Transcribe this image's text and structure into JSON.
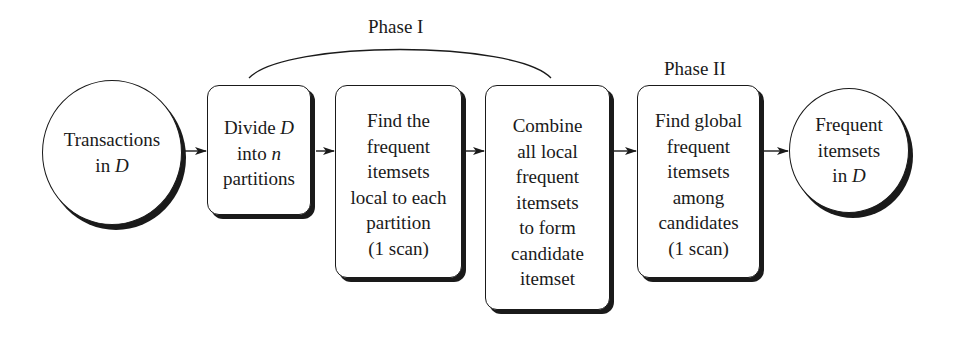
{
  "diagram": {
    "type": "flowchart",
    "phases": [
      {
        "label": "Phase I",
        "spans": [
          "divide",
          "find_local",
          "combine"
        ]
      },
      {
        "label": "Phase II",
        "spans": [
          "find_global"
        ]
      }
    ],
    "nodes": [
      {
        "id": "input",
        "shape": "circle",
        "lines": [
          "Transactions",
          "in D"
        ]
      },
      {
        "id": "divide",
        "shape": "rounded-box",
        "lines": [
          "Divide D",
          "into n",
          "partitions"
        ]
      },
      {
        "id": "find_local",
        "shape": "rounded-box",
        "lines": [
          "Find the",
          "frequent",
          "itemsets",
          "local to each",
          "partition",
          "(1 scan)"
        ]
      },
      {
        "id": "combine",
        "shape": "rounded-box",
        "lines": [
          "Combine",
          "all local",
          "frequent",
          "itemsets",
          "to form",
          "candidate",
          "itemset"
        ]
      },
      {
        "id": "find_global",
        "shape": "rounded-box",
        "lines": [
          "Find global",
          "frequent",
          "itemsets",
          "among",
          "candidates",
          "(1 scan)"
        ]
      },
      {
        "id": "output",
        "shape": "circle",
        "lines": [
          "Frequent",
          "itemsets",
          "in D"
        ]
      }
    ],
    "edges": [
      {
        "from": "input",
        "to": "divide"
      },
      {
        "from": "divide",
        "to": "find_local"
      },
      {
        "from": "find_local",
        "to": "combine"
      },
      {
        "from": "combine",
        "to": "find_global"
      },
      {
        "from": "find_global",
        "to": "output"
      }
    ],
    "text": {
      "phase1": "Phase I",
      "phase2": "Phase II",
      "input_l1": "Transactions",
      "input_l2a": "in ",
      "input_l2b": "D",
      "divide_l1a": "Divide ",
      "divide_l1b": "D",
      "divide_l2a": "into ",
      "divide_l2b": "n",
      "divide_l3": "partitions",
      "local_l1": "Find the",
      "local_l2": "frequent",
      "local_l3": "itemsets",
      "local_l4": "local to each",
      "local_l5": "partition",
      "local_l6": "(1 scan)",
      "combine_l1": "Combine",
      "combine_l2": "all local",
      "combine_l3": "frequent",
      "combine_l4": "itemsets",
      "combine_l5": "to form",
      "combine_l6": "candidate",
      "combine_l7": "itemset",
      "global_l1": "Find global",
      "global_l2": "frequent",
      "global_l3": "itemsets",
      "global_l4": "among",
      "global_l5": "candidates",
      "global_l6": "(1 scan)",
      "output_l1": "Frequent",
      "output_l2": "itemsets",
      "output_l3a": "in ",
      "output_l3b": "D"
    },
    "colors": {
      "ink": "#1a1a1a",
      "background": "#ffffff"
    }
  }
}
